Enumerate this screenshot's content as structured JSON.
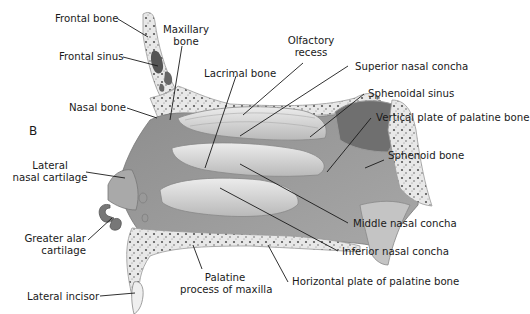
{
  "figure": {
    "panel_letter": "B",
    "colors": {
      "bone": "#e6e6e6",
      "bone_spongy": "#5a5a5a",
      "cavity": "#9a9a9a",
      "concha": "#d2d2d2",
      "sinus": "#7a7a7a",
      "leader_line": "#1a1a1a"
    }
  },
  "labels": {
    "frontal_bone": "Frontal bone",
    "frontal_sinus": "Frontal sinus",
    "maxillary_bone_1": "Maxillary",
    "maxillary_bone_2": "bone",
    "lacrimal_bone": "Lacrimal bone",
    "olfactory_recess_1": "Olfactory",
    "olfactory_recess_2": "recess",
    "superior_nasal_concha": "Superior nasal concha",
    "sphenoidal_sinus": "Sphenoidal sinus",
    "vertical_plate": "Vertical plate of palatine bone",
    "sphenoid_bone": "Sphenoid bone",
    "nasal_bone": "Nasal bone",
    "lateral_nasal_cartilage_1": "Lateral",
    "lateral_nasal_cartilage_2": "nasal cartilage",
    "greater_alar_cartilage_1": "Greater alar",
    "greater_alar_cartilage_2": "cartilage",
    "lateral_incisor": "Lateral incisor",
    "palatine_process_1": "Palatine",
    "palatine_process_2": "process of maxilla",
    "horizontal_plate": "Horizontal plate of palatine bone",
    "middle_nasal_concha": "Middle nasal concha",
    "inferior_nasal_concha": "Inferior nasal concha"
  }
}
